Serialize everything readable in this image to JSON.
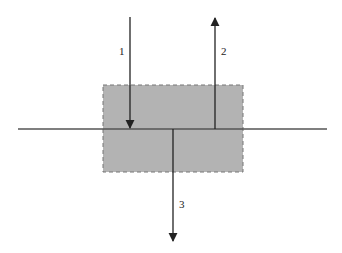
{
  "diagram": {
    "region": {
      "fill": "#b3b3b3",
      "stroke": "#777777",
      "stroke_style": "dashed"
    },
    "baseline": {
      "color": "#555555"
    },
    "arrows": [
      {
        "id": "1",
        "label": "1",
        "direction": "down",
        "color": "#222222"
      },
      {
        "id": "2",
        "label": "2",
        "direction": "up",
        "color": "#222222"
      },
      {
        "id": "3",
        "label": "3",
        "direction": "down",
        "color": "#222222"
      }
    ]
  }
}
